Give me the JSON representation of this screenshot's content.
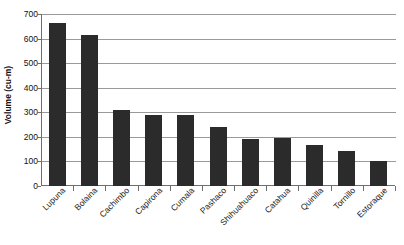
{
  "chart_data": {
    "type": "bar",
    "title": "",
    "subtitle": "",
    "xlabel": "",
    "ylabel": "Volume (cu-m)",
    "ylim": [
      0,
      700
    ],
    "ytick_step": 100,
    "yticks": [
      0,
      100,
      200,
      300,
      400,
      500,
      600,
      700
    ],
    "ytick_labels": [
      "0",
      "100",
      "200",
      "300",
      "400",
      "500",
      "600",
      "700"
    ],
    "grid": "horizontal",
    "legend": "none",
    "bar_color": "#2b2b2b",
    "gridline_color": "#9a9a9a",
    "axis_color": "#6f6f6f",
    "background_color": "#ffffff",
    "xtick_label_rotation": -45,
    "categories": [
      "Lupuna",
      "Bolaina",
      "Cachimbo",
      "Capirona",
      "Cumala",
      "Pashaco",
      "Shihuahuaco",
      "Catahua",
      "Quinilla",
      "Tornillo",
      "Estoraque"
    ],
    "values": [
      663,
      615,
      308,
      287,
      287,
      240,
      193,
      194,
      168,
      144,
      102
    ]
  }
}
